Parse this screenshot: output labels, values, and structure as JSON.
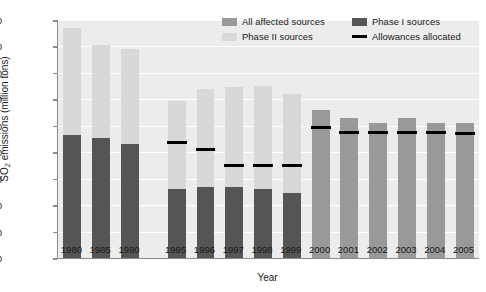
{
  "chart_data": {
    "type": "bar",
    "title": "",
    "xlabel": "Year",
    "ylabel": "SO2 emissions (million tons)",
    "ylabel_base": "SO",
    "ylabel_sub": "2",
    "ylabel_rest": " emissions (million tons)",
    "ylim": [
      0.0,
      18.0
    ],
    "ytick_step": 2.0,
    "yticks": [
      "0.0",
      "2.0",
      "4.0",
      "6.0",
      "8.0",
      "10.0",
      "12.0",
      "14.0",
      "16.0",
      "18.0"
    ],
    "ytick_values": [
      0.0,
      2.0,
      4.0,
      6.0,
      8.0,
      10.0,
      12.0,
      14.0,
      16.0,
      18.0
    ],
    "grid": "horizontal-white",
    "legend_position": "top-right-inside",
    "categories": [
      "1980",
      "1985",
      "1990",
      "1995",
      "1996",
      "1997",
      "1998",
      "1999",
      "2000",
      "2001",
      "2002",
      "2003",
      "2004",
      "2005"
    ],
    "group_gap_after": "1990",
    "series": [
      {
        "name": "All affected sources",
        "color": "#999999",
        "values": [
          null,
          null,
          null,
          null,
          null,
          null,
          null,
          null,
          11.2,
          10.6,
          10.2,
          10.6,
          10.2,
          10.2
        ]
      },
      {
        "name": "Phase I sources",
        "color": "#555555",
        "values": [
          9.3,
          9.1,
          8.6,
          5.2,
          5.4,
          5.4,
          5.2,
          4.9,
          null,
          null,
          null,
          null,
          null,
          null
        ]
      },
      {
        "name": "Phase II sources",
        "color": "#d8d8d8",
        "values": [
          8.1,
          7.0,
          7.2,
          6.7,
          7.4,
          7.5,
          7.8,
          7.5,
          null,
          null,
          null,
          null,
          null,
          null
        ]
      }
    ],
    "stacked_totals": [
      17.4,
      16.1,
      15.8,
      11.9,
      12.8,
      12.9,
      13.0,
      12.4,
      11.2,
      10.6,
      10.2,
      10.6,
      10.2,
      10.2
    ],
    "allowances": {
      "name": "Allowances allocated",
      "color": "#000000",
      "values": [
        null,
        null,
        null,
        8.7,
        8.2,
        7.0,
        7.0,
        7.0,
        9.9,
        9.5,
        9.5,
        9.5,
        9.5,
        9.4
      ]
    },
    "legend": [
      {
        "label": "All affected sources",
        "color": "#999999",
        "type": "box"
      },
      {
        "label": "Phase I sources",
        "color": "#555555",
        "type": "box"
      },
      {
        "label": "Phase II sources",
        "color": "#d8d8d8",
        "type": "box"
      },
      {
        "label": "Allowances allocated",
        "color": "#000000",
        "type": "line"
      }
    ]
  },
  "colors": {
    "plot_background": "#ececec",
    "gridline": "#ffffff",
    "axis": "#8a8a8a",
    "text": "#1a1a1a"
  }
}
